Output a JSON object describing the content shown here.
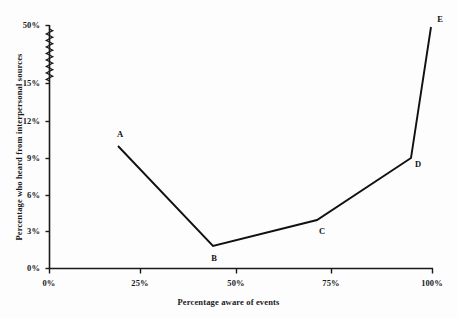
{
  "chart_data": {
    "type": "line",
    "title": "",
    "xlabel": "Percentage aware of events",
    "ylabel": "Percentage who heard from interpersonal sources",
    "xlim": [
      0,
      100
    ],
    "ylim": [
      0,
      50
    ],
    "grid": false,
    "legend": null,
    "axis_break": {
      "axis": "y",
      "from": 15,
      "to": 50,
      "style": "zigzag"
    },
    "xticks": [
      "0%",
      "25%",
      "50%",
      "75%",
      "100%"
    ],
    "xtick_values": [
      0,
      25,
      50,
      75,
      100
    ],
    "yticks": [
      "0%",
      "3%",
      "6%",
      "9%",
      "12%",
      "15%",
      "50%"
    ],
    "ytick_values": [
      0,
      3,
      6,
      9,
      12,
      15,
      50
    ],
    "point_labels": [
      "A",
      "B",
      "C",
      "D",
      "E"
    ],
    "x": [
      18,
      43,
      70,
      95,
      100
    ],
    "values": [
      10.0,
      1.8,
      3.9,
      9.0,
      50.0
    ],
    "points": [
      {
        "label": "A",
        "x": 18,
        "y": 10.0
      },
      {
        "label": "B",
        "x": 43,
        "y": 1.8
      },
      {
        "label": "C",
        "x": 70,
        "y": 3.9
      },
      {
        "label": "D",
        "x": 95,
        "y": 9.0
      },
      {
        "label": "E",
        "x": 100,
        "y": 50.0
      }
    ],
    "line_color": "#111111",
    "background_color": "#fdfdfd"
  },
  "ticks": {
    "y": [
      {
        "label": "50%",
        "px": 25
      },
      {
        "label": "15%",
        "px": 83
      },
      {
        "label": "12%",
        "px": 121
      },
      {
        "label": "9%",
        "px": 158
      },
      {
        "label": "6%",
        "px": 195
      },
      {
        "label": "3%",
        "px": 231
      },
      {
        "label": "0%",
        "px": 268
      }
    ],
    "x": [
      {
        "label": "0%",
        "px": 49
      },
      {
        "label": "25%",
        "px": 140
      },
      {
        "label": "50%",
        "px": 236
      },
      {
        "label": "75%",
        "px": 331
      },
      {
        "label": "100%",
        "px": 432
      }
    ]
  },
  "series_points_px": [
    {
      "label": "A",
      "px": 118,
      "py": 146,
      "lx": 120,
      "ly": 134
    },
    {
      "label": "B",
      "px": 213,
      "py": 246,
      "lx": 214,
      "ly": 258
    },
    {
      "label": "C",
      "px": 317,
      "py": 220,
      "lx": 322,
      "ly": 231
    },
    {
      "label": "D",
      "px": 411,
      "py": 158,
      "lx": 418,
      "ly": 164
    },
    {
      "label": "E",
      "px": 431,
      "py": 27,
      "lx": 440,
      "ly": 19
    }
  ]
}
